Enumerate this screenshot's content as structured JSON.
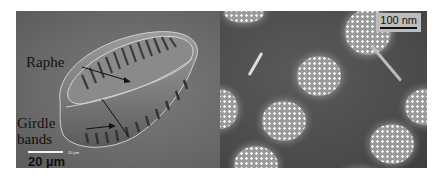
{
  "figure": {
    "left_panel": {
      "labels": {
        "raphe": "Raphe",
        "girdle_line1": "Girdle",
        "girdle_line2": "bands"
      },
      "scale_bar": {
        "label": "20 µm",
        "small_label": "20 µm"
      }
    },
    "right_panel": {
      "scale_bar": {
        "label": "100 nm"
      }
    }
  }
}
